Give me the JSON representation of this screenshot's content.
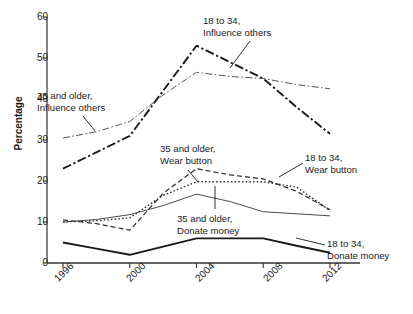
{
  "chart_data": {
    "type": "line",
    "title": "",
    "xlabel": "",
    "ylabel": "Percentage",
    "x": [
      1996,
      2000,
      2004,
      2008,
      2012
    ],
    "xtick_labels": [
      "1996",
      "2000",
      "2004",
      "2008",
      "2012"
    ],
    "ytick_labels": [
      "0",
      "10",
      "20",
      "30",
      "40",
      "50",
      "60"
    ],
    "ylim": [
      0,
      60
    ],
    "xlim": [
      1996,
      2012
    ],
    "grid": false,
    "legend_position": "inline-annotations",
    "series": [
      {
        "name": "18 to 34, Influence others",
        "style": "dash-dot-thick",
        "color": "#1a1a1a",
        "values": [
          23,
          31,
          53,
          45,
          31.5
        ],
        "x_detail": [
          1996,
          1998,
          2000,
          2002,
          2004,
          2006,
          2008,
          2010,
          2012
        ],
        "values_detail": [
          23,
          27,
          31,
          42,
          53,
          49,
          45,
          38,
          31.5
        ]
      },
      {
        "name": "35 and older, Influence others",
        "style": "dash-dot-thin",
        "color": "#555555",
        "values": [
          30.5,
          34.5,
          46.5,
          45,
          42.5
        ],
        "x_detail": [
          1996,
          1998,
          2000,
          2002,
          2004,
          2006,
          2008,
          2010,
          2012
        ],
        "values_detail": [
          30.5,
          32,
          34.5,
          41,
          46.5,
          45.5,
          45,
          43.5,
          42.5
        ]
      },
      {
        "name": "35 and older, Wear button",
        "style": "dashed",
        "color": "#2b2b2b",
        "values": [
          10.5,
          8,
          23,
          20.5,
          13
        ],
        "x_detail": [
          1996,
          1998,
          2000,
          2002,
          2004,
          2006,
          2008,
          2010,
          2012
        ],
        "values_detail": [
          10.5,
          9.6,
          8,
          17,
          23,
          21.5,
          20.5,
          17.5,
          13
        ]
      },
      {
        "name": "35 and older, Donate money",
        "style": "dotted",
        "color": "#2b2b2b",
        "values": [
          10,
          11,
          19.8,
          19.8,
          12.8
        ],
        "x_detail": [
          1996,
          1998,
          2000,
          2002,
          2004,
          2006,
          2008,
          2010,
          2012
        ],
        "values_detail": [
          10,
          10.3,
          11,
          16.5,
          19.8,
          19.8,
          19.8,
          18.5,
          12.8
        ]
      },
      {
        "name": "18 to 34, Wear button",
        "style": "solid-thin",
        "color": "#4a4a4a",
        "values": [
          10,
          11.8,
          16.8,
          12.5,
          11.5
        ],
        "x_detail": [
          1996,
          1998,
          2000,
          2002,
          2004,
          2006,
          2008,
          2010,
          2012
        ],
        "values_detail": [
          10,
          10.6,
          11.8,
          14,
          16.8,
          15,
          12.5,
          12,
          11.5
        ]
      },
      {
        "name": "18 to 34, Donate money",
        "style": "solid-thick",
        "color": "#1a1a1a",
        "values": [
          5,
          2,
          6,
          6,
          2.5
        ],
        "x_detail": [
          1996,
          1998,
          2000,
          2002,
          2004,
          2006,
          2008,
          2010,
          2012
        ],
        "values_detail": [
          5,
          3.5,
          2,
          4,
          6,
          6,
          6,
          4.2,
          2.5
        ]
      }
    ],
    "annotations": [
      {
        "id": "ann-35-influence",
        "line1": "35 and older,",
        "line2": "Influence others"
      },
      {
        "id": "ann-18-influence",
        "line1": "18 to 34,",
        "line2": "Influence others"
      },
      {
        "id": "ann-35-wear",
        "line1": "35 and older,",
        "line2": "Wear button"
      },
      {
        "id": "ann-18-wear",
        "line1": "18 to 34,",
        "line2": "Wear button"
      },
      {
        "id": "ann-35-donate",
        "line1": "35 and older,",
        "line2": "Donate money"
      },
      {
        "id": "ann-18-donate",
        "line1": "18 to 34,",
        "line2": "Donate money"
      }
    ]
  }
}
